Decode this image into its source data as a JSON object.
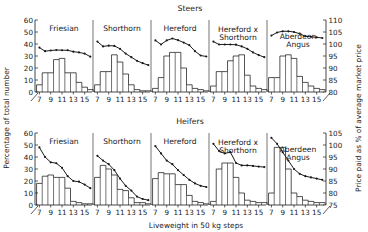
{
  "figure": {
    "left_axis_label": "Percentage of total number",
    "right_axis_label": "Price paid as % of average market price",
    "x_axis_label": "Liveweight in 50 kg steps",
    "row_titles": [
      "Steers",
      "Heifers"
    ],
    "colors": {
      "ink": "#1a1a1a",
      "background": "#ffffff"
    }
  },
  "chart_data": {
    "type": "bar",
    "xlabel": "Liveweight in 50 kg steps",
    "ylabel": "Percentage of total number",
    "y2label": "Price paid as % of average market price",
    "grid": false,
    "legend": "none",
    "x": [
      7,
      8,
      9,
      10,
      11,
      12,
      13,
      14,
      15,
      16
    ],
    "xtick_labels": [
      "7",
      "9",
      "11",
      "13",
      "15"
    ],
    "xtick_values": [
      7,
      9,
      11,
      13,
      15
    ],
    "axis_break": true,
    "rows": [
      {
        "name": "Steers",
        "ylim": [
          0,
          60
        ],
        "yticks": [
          0,
          10,
          20,
          30,
          40,
          50,
          60
        ],
        "y2lim": [
          80,
          110
        ],
        "y2ticks": [
          80,
          85,
          90,
          95,
          100,
          105,
          110
        ],
        "panels": [
          {
            "title": "Friesian",
            "bars": {
              "name": "Percentage of total number",
              "values": [
                6,
                16,
                16,
                27,
                28,
                16,
                16,
                8,
                4,
                2
              ]
            },
            "line": {
              "name": "Price paid as % of average market price",
              "values": [
                98.5,
                97.0,
                97.3,
                97.5,
                97.4,
                97.4,
                96.8,
                96.5,
                96.0,
                94.7
              ]
            }
          },
          {
            "title": "Shorthorn",
            "bars": {
              "name": "Percentage of total number",
              "values": [
                6,
                17,
                17,
                31,
                25,
                15,
                6,
                2,
                1,
                1
              ]
            },
            "line": {
              "name": "Price paid as % of average market price",
              "values": [
                101.0,
                99.0,
                99.3,
                99.2,
                98.0,
                96.0,
                94.5,
                93.0,
                92.0,
                91.2
              ]
            }
          },
          {
            "title": "Hereford",
            "bars": {
              "name": "Percentage of total number",
              "values": [
                3,
                12,
                30,
                33,
                33,
                20,
                6,
                3,
                2,
                1
              ]
            },
            "line": {
              "name": "Price paid as % of average market price",
              "values": [
                101.5,
                99.8,
                101.5,
                102.3,
                101.6,
                100.6,
                99.5,
                97.0,
                95.2,
                94.8
              ]
            }
          },
          {
            "title": "Hereford x Shorthorn",
            "bars": {
              "name": "Percentage of total number",
              "values": [
                5,
                17,
                17,
                26,
                30,
                31,
                14,
                5,
                3,
                2
              ]
            },
            "line": {
              "name": "Price paid as % of average market price",
              "values": [
                101.0,
                99.8,
                99.8,
                99.8,
                99.7,
                99.0,
                98.0,
                96.5,
                95.4,
                94.5
              ]
            }
          },
          {
            "title": "Aberdeen Angus",
            "bars": {
              "name": "Percentage of total number",
              "values": [
                12,
                12,
                30,
                31,
                28,
                13,
                8,
                5,
                3,
                2
              ]
            },
            "line": {
              "name": "Price paid as % of average market price",
              "values": [
                103.5,
                104.8,
                105.3,
                105.3,
                105.0,
                104.3,
                103.2,
                103.0,
                102.8,
                102.5
              ]
            }
          }
        ]
      },
      {
        "name": "Heifers",
        "ylim": [
          0,
          60
        ],
        "yticks": [
          0,
          10,
          20,
          30,
          40,
          50,
          60
        ],
        "y2lim": [
          75,
          105
        ],
        "y2ticks": [
          75,
          80,
          85,
          90,
          95,
          100,
          105
        ],
        "panels": [
          {
            "title": "Friesian",
            "bars": {
              "name": "Percentage of total number",
              "values": [
                18,
                24,
                25,
                23,
                23,
                14,
                3,
                2,
                1,
                1
              ]
            },
            "line": {
              "name": "Price paid as % of average market price",
              "values": [
                99.0,
                95.0,
                92.8,
                92.4,
                90.5,
                87.0,
                85.0,
                84.7,
                83.5,
                82.0
              ]
            }
          },
          {
            "title": "Shorthorn",
            "bars": {
              "name": "Percentage of total number",
              "values": [
                23,
                33,
                30,
                25,
                13,
                12,
                6,
                2,
                2,
                1
              ]
            },
            "line": {
              "name": "Price paid as % of average market price",
              "values": [
                95.5,
                93.5,
                92.0,
                89.5,
                86.0,
                83.0,
                81.0,
                78.5,
                77.5,
                77.0
              ]
            }
          },
          {
            "title": "Hereford",
            "bars": {
              "name": "Percentage of total number",
              "values": [
                22,
                27,
                26,
                26,
                17,
                17,
                8,
                3,
                2,
                1
              ]
            },
            "line": {
              "name": "Price paid as % of average market price",
              "values": [
                99.5,
                96.5,
                93.5,
                92.0,
                89.5,
                87.5,
                85.5,
                84.0,
                83.0,
                82.5
              ]
            }
          },
          {
            "title": "Hereford x Shorthorn",
            "bars": {
              "name": "Percentage of total number",
              "values": [
                3,
                30,
                35,
                35,
                23,
                10,
                4,
                3,
                2,
                2
              ]
            },
            "line": {
              "name": "Price paid as % of average market price",
              "values": [
                100.5,
                97.5,
                96.5,
                97.0,
                92.5,
                91.5,
                91.5,
                91.3,
                91.0,
                90.8
              ]
            }
          },
          {
            "title": "Aberdeen Angus",
            "bars": {
              "name": "Percentage of total number",
              "values": [
                10,
                48,
                48,
                30,
                10,
                7,
                4,
                3,
                2,
                2
              ]
            },
            "line": {
              "name": "Price paid as % of average market price",
              "values": [
                103.0,
                100.5,
                97.0,
                93.5,
                90.0,
                88.0,
                87.0,
                86.5,
                86.0,
                85.5
              ]
            }
          }
        ]
      }
    ]
  }
}
